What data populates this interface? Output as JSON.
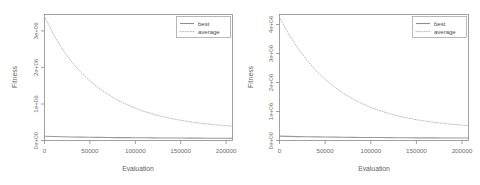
{
  "figure": {
    "background_color": "#ffffff",
    "panel_count": 2
  },
  "chart_data": [
    {
      "type": "line",
      "panel": "left",
      "title": "",
      "xlabel": "Evaluation",
      "ylabel": "Fitness",
      "xlim": [
        0,
        207000
      ],
      "ylim": [
        0,
        3450000
      ],
      "xticks": [
        0,
        50000,
        100000,
        150000,
        200000
      ],
      "xtick_labels": [
        "0",
        "50000",
        "100000",
        "150000",
        "200000"
      ],
      "yticks": [
        0,
        1000000,
        2000000,
        3000000
      ],
      "ytick_labels": [
        "0e+00",
        "1e+06",
        "2e+06",
        "3e+06"
      ],
      "grid": false,
      "legend_position": "top-right",
      "series": [
        {
          "name": "best",
          "style": "solid",
          "color": "#9a9a9a",
          "x": [
            0,
            10000,
            20000,
            30000,
            40000,
            50000,
            60000,
            70000,
            80000,
            90000,
            100000,
            110000,
            120000,
            130000,
            140000,
            150000,
            160000,
            170000,
            180000,
            190000,
            200000,
            207000
          ],
          "values": [
            115000,
            108000,
            102000,
            97000,
            93000,
            89000,
            86000,
            83000,
            80000,
            78000,
            76000,
            74000,
            72000,
            70000,
            68000,
            67000,
            65000,
            64000,
            62000,
            61000,
            60000,
            59000
          ]
        },
        {
          "name": "average",
          "style": "dotted",
          "color": "#b2b2b2",
          "x": [
            0,
            10000,
            20000,
            30000,
            40000,
            50000,
            60000,
            70000,
            80000,
            90000,
            100000,
            110000,
            120000,
            130000,
            140000,
            150000,
            160000,
            170000,
            180000,
            190000,
            200000,
            207000
          ],
          "values": [
            3400000,
            2900000,
            2490000,
            2150000,
            1870000,
            1630000,
            1430000,
            1260000,
            1110000,
            990000,
            885000,
            795000,
            720000,
            655000,
            600000,
            553000,
            513000,
            478000,
            450000,
            425000,
            405000,
            393000
          ]
        }
      ]
    },
    {
      "type": "line",
      "panel": "right",
      "title": "",
      "xlabel": "Evaluation",
      "ylabel": "Fitness",
      "xlim": [
        0,
        207000
      ],
      "ylim": [
        0,
        4350000
      ],
      "xticks": [
        0,
        50000,
        100000,
        150000,
        200000
      ],
      "xtick_labels": [
        "0",
        "50000",
        "100000",
        "150000",
        "200000"
      ],
      "yticks": [
        0,
        1000000,
        2000000,
        3000000,
        4000000
      ],
      "ytick_labels": [
        "0e+00",
        "1e+06",
        "2e+06",
        "3e+06",
        "4e+06"
      ],
      "grid": false,
      "legend_position": "top-right",
      "series": [
        {
          "name": "best",
          "style": "solid",
          "color": "#9a9a9a",
          "x": [
            0,
            10000,
            20000,
            30000,
            40000,
            50000,
            60000,
            70000,
            80000,
            90000,
            100000,
            110000,
            120000,
            130000,
            140000,
            150000,
            160000,
            170000,
            180000,
            190000,
            200000,
            207000
          ],
          "values": [
            150000,
            142000,
            135000,
            129000,
            124000,
            120000,
            116000,
            112000,
            109000,
            106000,
            103000,
            101000,
            98000,
            96000,
            94000,
            92000,
            90000,
            89000,
            87000,
            86000,
            85000,
            84000
          ]
        },
        {
          "name": "average",
          "style": "dotted",
          "color": "#b2b2b2",
          "x": [
            0,
            10000,
            20000,
            30000,
            40000,
            50000,
            60000,
            70000,
            80000,
            90000,
            100000,
            110000,
            120000,
            130000,
            140000,
            150000,
            160000,
            170000,
            180000,
            190000,
            200000,
            207000
          ],
          "values": [
            4250000,
            3680000,
            3190000,
            2770000,
            2410000,
            2110000,
            1850000,
            1630000,
            1440000,
            1280000,
            1145000,
            1030000,
            930000,
            848000,
            778000,
            718000,
            668000,
            625000,
            588000,
            557000,
            530000,
            515000
          ]
        }
      ]
    }
  ],
  "legend": {
    "entries": [
      {
        "label": "best",
        "style": "solid"
      },
      {
        "label": "average",
        "style": "dotted"
      }
    ]
  }
}
